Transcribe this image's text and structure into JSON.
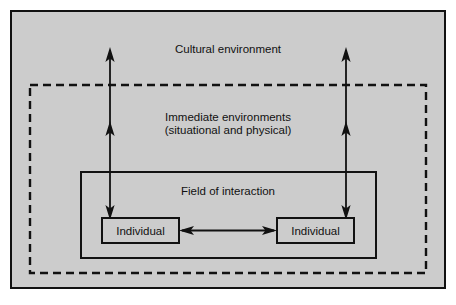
{
  "diagram": {
    "title": "Cultural environment",
    "canvas": {
      "width": 456,
      "height": 305,
      "background_color": "#ffffff",
      "fill_color": "#cccccc",
      "line_color": "#111111"
    },
    "layers": [
      {
        "id": "cultural-environment",
        "label": "Cultural environment",
        "border_style": "solid",
        "label_x": 228,
        "label_y": 50
      },
      {
        "id": "immediate-environments",
        "label_line_1": "Immediate environments",
        "label_line_2": "(situational and physical)",
        "border_style": "dashed",
        "label_x": 228,
        "label_y": 124
      },
      {
        "id": "field-of-interaction",
        "label": "Field of interaction",
        "border_style": "solid",
        "label_x": 228,
        "label_y": 192
      }
    ],
    "nodes": [
      {
        "id": "individual-left",
        "label": "Individual",
        "x": 102,
        "y": 218,
        "width": 77,
        "height": 24
      },
      {
        "id": "individual-right",
        "label": "Individual",
        "x": 277,
        "y": 218,
        "width": 77,
        "height": 24
      }
    ],
    "connectors": [
      {
        "id": "left-vertical-arrow",
        "orientation": "vertical",
        "heads": "both",
        "note": "double-headed arrow linking left individual up through all layers"
      },
      {
        "id": "right-vertical-arrow",
        "orientation": "vertical",
        "heads": "both",
        "note": "double-headed arrow linking right individual up through all layers"
      },
      {
        "id": "interaction-arrow",
        "orientation": "horizontal",
        "heads": "both",
        "note": "double-headed arrow between the two individuals"
      }
    ]
  }
}
